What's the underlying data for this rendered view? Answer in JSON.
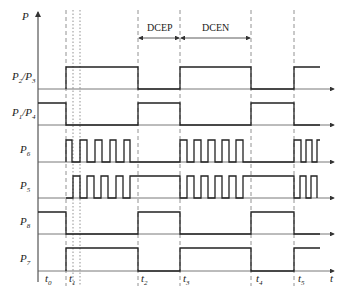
{
  "axis": {
    "y_label": "P",
    "x_label": "t"
  },
  "regions": [
    {
      "label": "DCEP",
      "from": "t2",
      "to": "t3"
    },
    {
      "label": "DCEN",
      "from": "t3",
      "to": "t4"
    }
  ],
  "signals": [
    {
      "name": "P2/P3",
      "main": "P",
      "sub1": "2",
      "sep": "/P",
      "sub2": "3"
    },
    {
      "name": "P1/P4",
      "main": "P",
      "sub1": "1",
      "sep": "/P",
      "sub2": "4"
    },
    {
      "name": "P6",
      "main": "P",
      "sub1": "6"
    },
    {
      "name": "P5",
      "main": "P",
      "sub1": "5"
    },
    {
      "name": "P8",
      "main": "P",
      "sub1": "8"
    },
    {
      "name": "P7",
      "main": "P",
      "sub1": "7"
    }
  ],
  "time_marks": [
    {
      "main": "t",
      "sub": "0"
    },
    {
      "main": "t",
      "sub": "1"
    },
    {
      "main": "t",
      "sub": "2"
    },
    {
      "main": "t",
      "sub": "3"
    },
    {
      "main": "t",
      "sub": "4"
    },
    {
      "main": "t",
      "sub": "5"
    }
  ]
}
